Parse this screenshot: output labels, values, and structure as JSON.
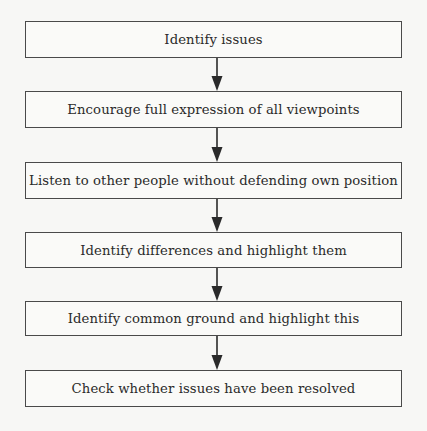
{
  "diagram": {
    "type": "flowchart",
    "direction": "top-to-bottom",
    "steps": [
      {
        "label": "Identify issues"
      },
      {
        "label": "Encourage full expression of all viewpoints"
      },
      {
        "label": "Listen to other people without defending own position"
      },
      {
        "label": "Identify differences and highlight them"
      },
      {
        "label": "Identify common ground and highlight this"
      },
      {
        "label": "Check whether issues have been resolved"
      }
    ],
    "connectors": [
      {
        "from": 0,
        "to": 1,
        "icon": "arrow-down-icon"
      },
      {
        "from": 1,
        "to": 2,
        "icon": "arrow-down-icon"
      },
      {
        "from": 2,
        "to": 3,
        "icon": "arrow-down-icon"
      },
      {
        "from": 3,
        "to": 4,
        "icon": "arrow-down-icon"
      },
      {
        "from": 4,
        "to": 5,
        "icon": "arrow-down-icon"
      }
    ],
    "colors": {
      "line": "#2a2a2a",
      "text": "#2a2a2a",
      "background": "#f7f7f5"
    }
  }
}
